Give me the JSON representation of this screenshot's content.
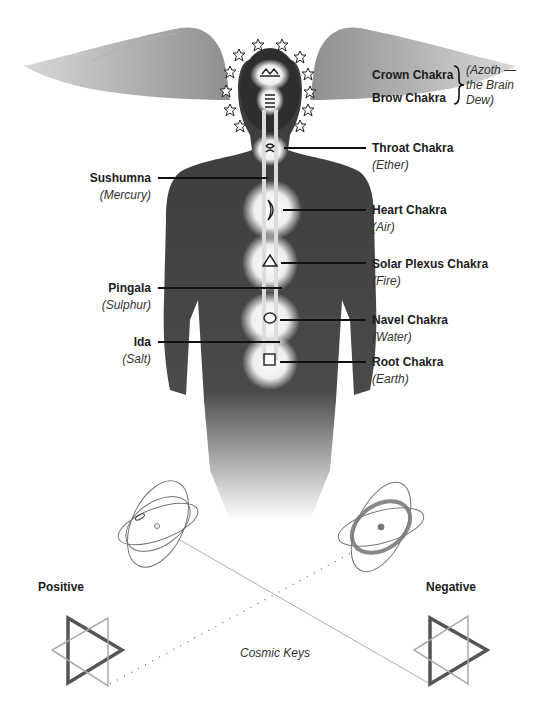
{
  "figure": {
    "right_labels": [
      {
        "name": "Crown Chakra",
        "element": null,
        "y": 75
      },
      {
        "name": "Brow Chakra",
        "element": null,
        "y": 98
      },
      {
        "name": "Throat Chakra",
        "element": "(Ether)",
        "y": 148
      },
      {
        "name": "Heart Chakra",
        "element": "(Air)",
        "y": 210
      },
      {
        "name": "Solar Plexus Chakra",
        "element": "(Fire)",
        "y": 263
      },
      {
        "name": "Navel Chakra",
        "element": "(Water)",
        "y": 320
      },
      {
        "name": "Root Chakra",
        "element": "(Earth)",
        "y": 362
      }
    ],
    "crown_brow_note": [
      "(Azoth —",
      "the Brain",
      "Dew)"
    ],
    "left_labels": [
      {
        "name": "Sushumna",
        "element": "(Mercury)"
      },
      {
        "name": "Pingala",
        "element": "(Sulphur)"
      },
      {
        "name": "Ida",
        "element": "(Salt)"
      }
    ],
    "chakra_symbols": [
      {
        "chakra": "Crown",
        "icon": "lotus-icon"
      },
      {
        "chakra": "Brow",
        "icon": "coil-icon"
      },
      {
        "chakra": "Throat",
        "icon": "spiral-icon"
      },
      {
        "chakra": "Heart",
        "icon": "crescent-moon-icon"
      },
      {
        "chakra": "Solar Plexus",
        "icon": "triangle-icon"
      },
      {
        "chakra": "Navel",
        "icon": "circle-icon"
      },
      {
        "chakra": "Root",
        "icon": "square-icon"
      }
    ],
    "halo_star_count": 12,
    "positive_label": "Positive",
    "negative_label": "Negative",
    "caption": "Cosmic Keys",
    "colors": {
      "ink": "#1c1c1c",
      "body": "#4a4a4a",
      "wing": "#9a9a9a",
      "glow": "#f4f4f4"
    }
  }
}
